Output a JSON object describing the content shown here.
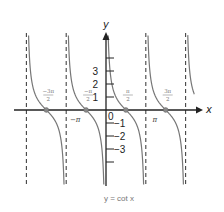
{
  "chart_data": {
    "type": "line",
    "title": "y = cot x",
    "function": "cot",
    "xlabel": "x",
    "ylabel": "y",
    "xlim": [
      -6.7,
      7.6
    ],
    "ylim": [
      -5.8,
      5.8
    ],
    "grid": false,
    "asymptotes_x": [
      "-2π",
      "-π",
      "0",
      "π",
      "2π"
    ],
    "asymptote_values": [
      -6.2832,
      -3.1416,
      0,
      3.1416,
      6.2832
    ],
    "zeros": [
      {
        "label_num": "−3π",
        "label_den": "2",
        "value": -4.7124
      },
      {
        "label_num": "−π",
        "label_den": "2",
        "value": -1.5708
      },
      {
        "label_num": "π",
        "label_den": "2",
        "value": 1.5708
      },
      {
        "label_num": "3π",
        "label_den": "2",
        "value": 4.7124
      }
    ],
    "x_tick_labels": [
      {
        "label": "−π",
        "value": -3.1416
      },
      {
        "label": "π",
        "value": 3.1416
      },
      {
        "label": "0",
        "value": 0
      }
    ],
    "y_ticks": [
      {
        "label": "3",
        "value": 3
      },
      {
        "label": "2",
        "value": 2
      },
      {
        "label": "1",
        "value": 1
      },
      {
        "label": "",
        "value": 4
      },
      {
        "label": "−1",
        "value": -1
      },
      {
        "label": "−2",
        "value": -2
      },
      {
        "label": "−3",
        "value": -3
      },
      {
        "label": "",
        "value": -4
      }
    ],
    "branches": [
      {
        "from": -6.2832,
        "to": -3.1416
      },
      {
        "from": -3.1416,
        "to": 0
      },
      {
        "from": 0,
        "to": 3.1416
      },
      {
        "from": 3.1416,
        "to": 6.2832
      }
    ],
    "partial_branch": {
      "from": 6.2832,
      "to": 7.2
    }
  },
  "colors": {
    "curve": "#777777",
    "axis": "#222222",
    "asymptote": "#444444",
    "zero_dot": "#888888"
  }
}
